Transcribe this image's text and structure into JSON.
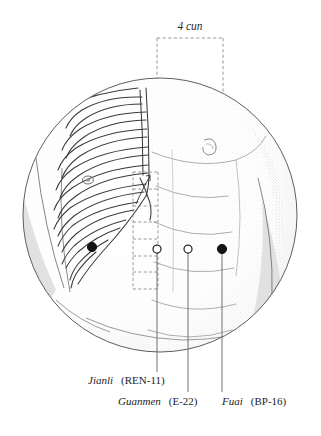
{
  "figure": {
    "background_color": "#ffffff",
    "ink_color": "#1d1d1d",
    "dash_color": "#8c8c8c",
    "shade_color": "#d9d9d9",
    "stipple_color": "#bdbdbd"
  },
  "measure": {
    "label": "4 cun",
    "units": "cun",
    "value": 4,
    "box_left_x": 157,
    "box_right_x": 223,
    "top_rule_y": 38
  },
  "scale_ladder": {
    "name": "cun-measuring-ladder",
    "left_x": 133,
    "right_x": 158,
    "top_y": 172,
    "bottom_y": 289,
    "rungs": 7
  },
  "points": [
    {
      "id": "ren-11",
      "name": "Jianli",
      "code": "(REN-11)",
      "marker": "open",
      "x": 157,
      "y": 249,
      "leader_end_y": 372,
      "label_x": 88,
      "label_y": 384
    },
    {
      "id": "e-22",
      "name": "Guanmen",
      "code": "(E-22)",
      "marker": "open",
      "x": 188,
      "y": 249,
      "leader_end_y": 392,
      "label_x": 118,
      "label_y": 405
    },
    {
      "id": "bp-16",
      "name": "Fuai",
      "code": "(BP-16)",
      "marker": "filled",
      "x": 222,
      "y": 249,
      "leader_end_y": 392,
      "label_x": 222,
      "label_y": 405
    }
  ],
  "anatomy_markers": [
    {
      "id": "rib-point",
      "marker": "filled",
      "x": 92,
      "y": 247
    },
    {
      "id": "nipple-left",
      "x": 88,
      "y": 180
    },
    {
      "id": "nipple-right",
      "x": 210,
      "y": 145
    }
  ],
  "frame": {
    "shape": "circle",
    "center_x": 160,
    "center_y": 215,
    "radius": 137
  }
}
